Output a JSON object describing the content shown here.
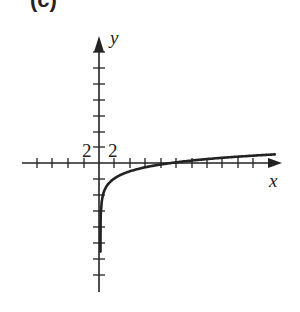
{
  "figure": {
    "part_label": "(c)"
  },
  "chart_data": {
    "type": "line",
    "title": "",
    "function": "y = ln(x)",
    "xlabel": "x",
    "ylabel": "y",
    "tick_labels": {
      "x": "2",
      "y": "2"
    },
    "x_tick_step": 2,
    "y_tick_step": 2,
    "xlim": [
      -8,
      22
    ],
    "ylim": [
      -16,
      16
    ],
    "grid": false,
    "legend": null,
    "series": [
      {
        "name": "y = ln x",
        "x": [
          0.0005,
          0.001,
          0.01,
          0.1,
          0.5,
          1,
          2,
          4,
          8,
          12,
          16,
          20,
          22
        ],
        "y": [
          -7.6,
          -6.9,
          -4.6,
          -2.3,
          -0.69,
          0,
          0.69,
          1.39,
          2.08,
          2.48,
          2.77,
          3.0,
          3.09
        ]
      }
    ],
    "colors": {
      "axis": "#222222",
      "curve": "#222222"
    }
  }
}
